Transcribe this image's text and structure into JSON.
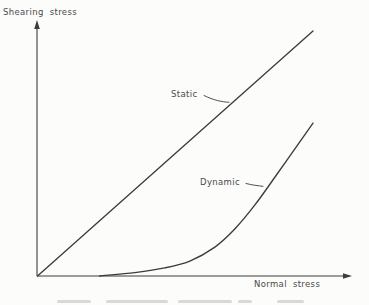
{
  "page": {
    "background": "#fcfcfa"
  },
  "colors": {
    "line": "#3c3c3c",
    "text": "#4a4a4a",
    "caption_fragment": "#bdbdb9"
  },
  "chart_data": {
    "type": "line",
    "title": "",
    "xlabel": "Normal stress",
    "ylabel": "Shearing stress",
    "xlim": [
      0,
      1
    ],
    "ylim": [
      0,
      1
    ],
    "grid": false,
    "ticks": "none",
    "axes_style": "arrow-ended, unlabeled qualitative axes from origin",
    "legend": "inline-annotations",
    "series": [
      {
        "name": "Static",
        "shape": "straight-line-through-origin",
        "points": [
          [
            0,
            0
          ],
          [
            1,
            1
          ]
        ]
      },
      {
        "name": "Dynamic",
        "shape": "concave-up-curve-tangent-to-x-axis",
        "points": [
          [
            0.225,
            0.0
          ],
          [
            0.353,
            0.014
          ],
          [
            0.462,
            0.033
          ],
          [
            0.553,
            0.061
          ],
          [
            0.644,
            0.118
          ],
          [
            0.716,
            0.192
          ],
          [
            0.789,
            0.29
          ],
          [
            0.862,
            0.404
          ],
          [
            0.931,
            0.514
          ],
          [
            1.0,
            0.624
          ]
        ]
      }
    ],
    "annotations": [
      {
        "text": "Static",
        "target_series": "Static"
      },
      {
        "text": "Dynamic",
        "target_series": "Dynamic"
      }
    ]
  }
}
